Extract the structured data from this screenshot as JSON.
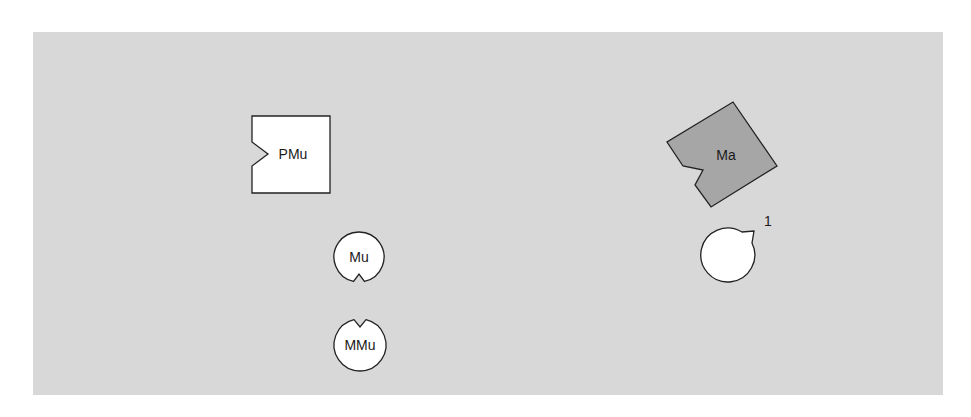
{
  "colors": {
    "page_background": "#ffffff",
    "panel_background": "#d8d8d8",
    "light_shape_fill": "#ffffff",
    "dark_shape_fill": "#a6a6a6",
    "stroke": "#222222"
  },
  "shapes": {
    "pmu": {
      "label": "PMu",
      "type": "notched-square",
      "notch_side": "left"
    },
    "mu": {
      "label": "Mu",
      "type": "notched-circle",
      "notch_side": "bottom"
    },
    "mmu": {
      "label": "MMu",
      "type": "notched-circle",
      "notch_side": "top"
    },
    "ma": {
      "label": "Ma",
      "type": "notched-square-rotated",
      "notch_side": "lower-left"
    },
    "one": {
      "label": "1",
      "type": "notched-circle",
      "notch_side": "lower-left"
    }
  }
}
